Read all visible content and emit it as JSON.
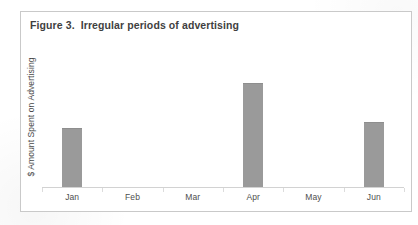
{
  "figure": {
    "title": "Figure 3.  Irregular periods of advertising",
    "border_color": "#c9c9c9",
    "background": "#ffffff"
  },
  "chart_data": {
    "type": "bar",
    "title": "Figure 3.  Irregular periods of advertising",
    "categories": [
      "Jan",
      "Feb",
      "Mar",
      "Apr",
      "May",
      "Jun"
    ],
    "values": [
      41,
      0,
      0,
      72,
      0,
      45
    ],
    "xlabel": "",
    "ylabel": "$ Amount Spent on Advertising",
    "ylim": [
      0,
      100
    ],
    "grid": false,
    "legend": false,
    "bar_color": "#9a9a9a",
    "axis_color": "#d2d2d2",
    "y_tick_labels": [],
    "annotations": []
  },
  "axis": {
    "y_caption": "$ Amount Spent on Advertising"
  }
}
